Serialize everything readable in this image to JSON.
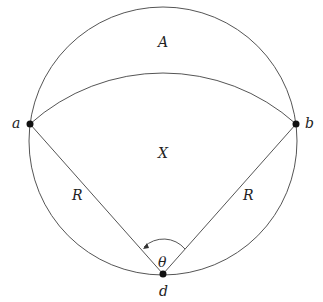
{
  "diagram": {
    "labels": {
      "region_top": "A",
      "region_mid": "X",
      "point_left": "a",
      "point_right": "b",
      "point_bottom": "d",
      "radius_left": "R",
      "radius_right": "R",
      "angle": "θ"
    },
    "colors": {
      "stroke": "#555555",
      "point": "#111111",
      "text": "#222222"
    }
  }
}
